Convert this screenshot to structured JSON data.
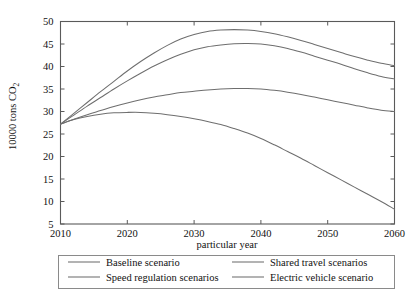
{
  "chart_data": {
    "type": "line",
    "title": "",
    "xlabel": "particular year",
    "ylabel": "10000 tons CO2",
    "ylabel_base": "10000 tons CO",
    "ylabel_sub": "2",
    "xlim": [
      2010,
      2060
    ],
    "ylim": [
      5,
      50
    ],
    "xticks": [
      2010,
      2020,
      2030,
      2040,
      2050,
      2060
    ],
    "yticks": [
      5,
      10,
      15,
      20,
      25,
      30,
      35,
      40,
      45,
      50
    ],
    "xtick_labels": [
      "2010",
      "2020",
      "2030",
      "2040",
      "2050",
      "2060"
    ],
    "ytick_labels": [
      "5",
      "10",
      "15",
      "20",
      "25",
      "30",
      "35",
      "40",
      "45",
      "50"
    ],
    "grid": false,
    "legend_position": "below-axes",
    "line_color": "#6e6e6e",
    "frame_color": "#5a5a5a",
    "x": [
      2010,
      2012,
      2014,
      2016,
      2018,
      2020,
      2022,
      2024,
      2026,
      2028,
      2030,
      2032,
      2034,
      2036,
      2038,
      2040,
      2042,
      2044,
      2046,
      2048,
      2050,
      2052,
      2054,
      2056,
      2058,
      2060
    ],
    "series": [
      {
        "name": "Baseline scenario",
        "values": [
          27.2,
          29.6,
          32.0,
          34.4,
          36.7,
          39.0,
          41.1,
          43.0,
          44.7,
          46.1,
          47.1,
          47.8,
          48.1,
          48.2,
          48.1,
          47.8,
          47.3,
          46.6,
          45.8,
          44.9,
          44.0,
          43.1,
          42.2,
          41.4,
          40.7,
          40.2
        ]
      },
      {
        "name": "Shared travel scenarios",
        "values": [
          27.2,
          29.2,
          31.2,
          33.1,
          35.0,
          36.8,
          38.5,
          40.1,
          41.5,
          42.7,
          43.7,
          44.4,
          44.8,
          45.05,
          45.1,
          45.0,
          44.6,
          44.0,
          43.2,
          42.3,
          41.4,
          40.5,
          39.5,
          38.6,
          37.8,
          37.2
        ]
      },
      {
        "name": "Speed regulation scenarios",
        "values": [
          27.2,
          28.3,
          29.3,
          30.2,
          31.1,
          31.9,
          32.6,
          33.2,
          33.7,
          34.2,
          34.5,
          34.8,
          35.0,
          35.1,
          35.12,
          35.0,
          34.7,
          34.3,
          33.8,
          33.2,
          32.6,
          32.0,
          31.4,
          30.8,
          30.3,
          30.0
        ]
      },
      {
        "name": "Electric vehicle scenario",
        "values": [
          27.2,
          28.2,
          28.9,
          29.4,
          29.7,
          29.8,
          29.8,
          29.6,
          29.3,
          28.9,
          28.4,
          27.8,
          27.1,
          26.2,
          25.2,
          24.0,
          22.6,
          21.1,
          19.6,
          18.0,
          16.4,
          14.8,
          13.2,
          11.6,
          10.0,
          8.3
        ]
      }
    ]
  },
  "legend": {
    "entries": [
      {
        "label": "Baseline scenario"
      },
      {
        "label": "Shared travel scenarios"
      },
      {
        "label": "Speed regulation scenarios"
      },
      {
        "label": "Electric vehicle scenario"
      }
    ]
  }
}
